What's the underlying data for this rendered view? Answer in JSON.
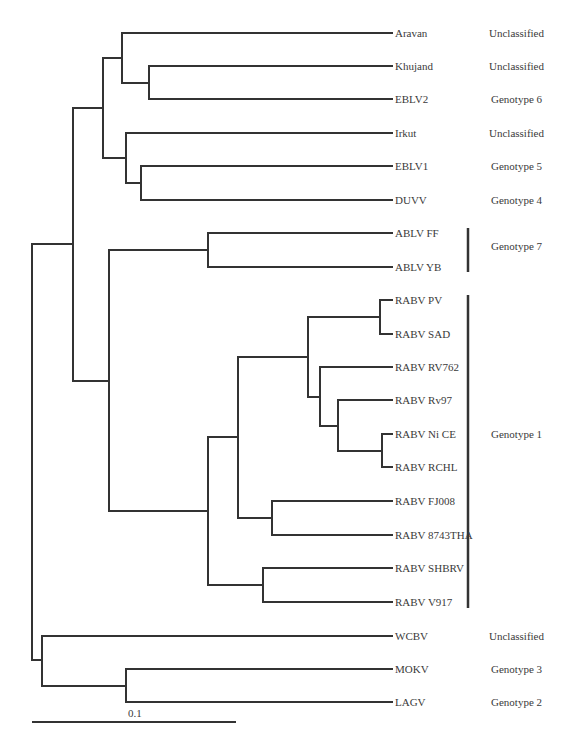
{
  "figure": {
    "type": "phylogenetic-tree",
    "line_color": "#333333",
    "scale_bar": {
      "label": "0.1",
      "x1": 32,
      "x2": 236,
      "y": 722
    }
  },
  "taxa": [
    {
      "name": "Aravan",
      "y": 33
    },
    {
      "name": "Khujand",
      "y": 66
    },
    {
      "name": "EBLV2",
      "y": 99
    },
    {
      "name": "Irkut",
      "y": 133
    },
    {
      "name": "EBLV1",
      "y": 166
    },
    {
      "name": "DUVV",
      "y": 200
    },
    {
      "name": "ABLV FF",
      "y": 233
    },
    {
      "name": "ABLV YB",
      "y": 267
    },
    {
      "name": "RABV PV",
      "y": 300
    },
    {
      "name": "RABV SAD",
      "y": 334
    },
    {
      "name": "RABV RV762",
      "y": 367
    },
    {
      "name": "RABV Rv97",
      "y": 400
    },
    {
      "name": "RABV Ni CE",
      "y": 434
    },
    {
      "name": "RABV RCHL",
      "y": 467
    },
    {
      "name": "RABV FJ008",
      "y": 501
    },
    {
      "name": "RABV 8743THA",
      "y": 535
    },
    {
      "name": "RABV SHBRV",
      "y": 568
    },
    {
      "name": "RABV V917",
      "y": 602
    },
    {
      "name": "WCBV",
      "y": 636
    },
    {
      "name": "MOKV",
      "y": 669
    },
    {
      "name": "LAGV",
      "y": 702
    }
  ],
  "classifications": [
    {
      "label": "Unclassified",
      "y": 33
    },
    {
      "label": "Unclassified",
      "y": 66
    },
    {
      "label": "Genotype 6",
      "y": 99
    },
    {
      "label": "Unclassified",
      "y": 133
    },
    {
      "label": "Genotype 5",
      "y": 166
    },
    {
      "label": "Genotype 4",
      "y": 200
    },
    {
      "label": "Genotype 7",
      "y": 246,
      "bracket": [
        228,
        272
      ]
    },
    {
      "label": "Genotype 1",
      "y": 434,
      "bracket": [
        295,
        608
      ]
    },
    {
      "label": "Unclassified",
      "y": 636
    },
    {
      "label": "Genotype 3",
      "y": 669
    },
    {
      "label": "Genotype 2",
      "y": 702
    }
  ],
  "chart_data": {
    "type": "tree",
    "title": "",
    "scale": "0.1 substitutions per site",
    "leaves": [
      "Aravan",
      "Khujand",
      "EBLV2",
      "Irkut",
      "EBLV1",
      "DUVV",
      "ABLV FF",
      "ABLV YB",
      "RABV PV",
      "RABV SAD",
      "RABV RV762",
      "RABV Rv97",
      "RABV Ni CE",
      "RABV RCHL",
      "RABV FJ008",
      "RABV 8743THA",
      "RABV SHBRV",
      "RABV V917",
      "WCBV",
      "MOKV",
      "LAGV"
    ],
    "newick": "((((Aravan,(Khujand,EBLV2)),(Irkut,(EBLV1,DUVV))),((ABLV FF,ABLV YB),((((RABV PV,RABV SAD),(RABV RV762,(RABV Rv97,(RABV Ni CE,RABV RCHL)))),(RABV FJ008,RABV 8743THA)),(RABV SHBRV,RABV V917)))),(WCBV,(MOKV,LAGV)));",
    "groups": [
      {
        "label": "Unclassified",
        "members": [
          "Aravan"
        ]
      },
      {
        "label": "Unclassified",
        "members": [
          "Khujand"
        ]
      },
      {
        "label": "Genotype 6",
        "members": [
          "EBLV2"
        ]
      },
      {
        "label": "Unclassified",
        "members": [
          "Irkut"
        ]
      },
      {
        "label": "Genotype 5",
        "members": [
          "EBLV1"
        ]
      },
      {
        "label": "Genotype 4",
        "members": [
          "DUVV"
        ]
      },
      {
        "label": "Genotype 7",
        "members": [
          "ABLV FF",
          "ABLV YB"
        ]
      },
      {
        "label": "Genotype 1",
        "members": [
          "RABV PV",
          "RABV SAD",
          "RABV RV762",
          "RABV Rv97",
          "RABV Ni CE",
          "RABV RCHL",
          "RABV FJ008",
          "RABV 8743THA",
          "RABV SHBRV",
          "RABV V917"
        ]
      },
      {
        "label": "Unclassified",
        "members": [
          "WCBV"
        ]
      },
      {
        "label": "Genotype 3",
        "members": [
          "MOKV"
        ]
      },
      {
        "label": "Genotype 2",
        "members": [
          "LAGV"
        ]
      }
    ]
  }
}
